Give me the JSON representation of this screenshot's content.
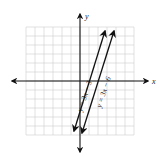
{
  "axes": {
    "x_label": "x",
    "y_label": "y"
  },
  "lines": [
    {
      "equation": "y = 3x − 3",
      "slope": 3,
      "intercept": -3
    },
    {
      "equation": "y = 3x − 6",
      "slope": 3,
      "intercept": -6
    }
  ],
  "grid": {
    "x_range": [
      -6,
      6
    ],
    "y_range": [
      -6,
      6
    ]
  },
  "colors": {
    "axis": "#111111",
    "grid": "#cfcfcf",
    "line": "#111111"
  }
}
